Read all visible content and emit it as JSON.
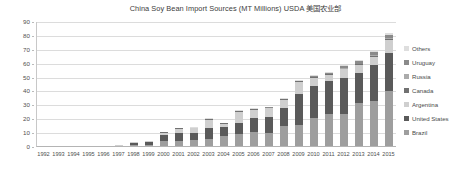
{
  "chart_data": {
    "type": "bar",
    "subtype": "stacked-column",
    "title": "China Soy Bean Import Sources (MT Millions) USDA  美国农业部",
    "xlabel": "",
    "ylabel": "",
    "ylim": [
      0,
      90
    ],
    "ytick_step": 10,
    "yticks": [
      0,
      10,
      20,
      30,
      40,
      50,
      60,
      70,
      80,
      90
    ],
    "grid": true,
    "legend_position": "right",
    "categories": [
      "1992",
      "1993",
      "1994",
      "1995",
      "1996",
      "1997",
      "1998",
      "1999",
      "2000",
      "2001",
      "2002",
      "2003",
      "2004",
      "2005",
      "2006",
      "2007",
      "2008",
      "2009",
      "2010",
      "2011",
      "2012",
      "2013",
      "2014",
      "2015"
    ],
    "series": [
      {
        "name": "Brazil",
        "color": "#9e9e9e",
        "values": [
          0,
          0,
          0,
          0,
          0.1,
          0.3,
          1.4,
          1.6,
          4.2,
          4.6,
          5.4,
          6.0,
          8.1,
          9.5,
          11.0,
          10.3,
          15.0,
          16.0,
          21.0,
          24.0,
          24.0,
          32.0,
          33.0,
          40.0
        ]
      },
      {
        "name": "United States",
        "color": "#5a5a5a",
        "values": [
          0,
          0,
          0,
          0,
          0.1,
          0.4,
          1.5,
          2.0,
          4.5,
          5.5,
          5.0,
          7.8,
          6.0,
          8.0,
          10.0,
          11.5,
          13.0,
          22.0,
          23.0,
          23.5,
          26.0,
          21.0,
          26.0,
          28.0
        ]
      },
      {
        "name": "Argentina",
        "color": "#cfcfcf",
        "values": [
          0,
          0,
          0,
          0,
          0,
          0.1,
          0.3,
          0.4,
          1.5,
          3.0,
          3.0,
          6.0,
          2.5,
          8.0,
          6.0,
          6.0,
          6.0,
          9.0,
          6.0,
          4.5,
          6.0,
          6.0,
          6.0,
          9.0
        ]
      },
      {
        "name": "Canada",
        "color": "#717171",
        "values": [
          0,
          0,
          0,
          0,
          0,
          0,
          0,
          0,
          0.1,
          0.1,
          0.1,
          0.1,
          0.2,
          0.2,
          0.2,
          0.3,
          0.3,
          0.4,
          0.4,
          0.5,
          0.5,
          0.6,
          0.7,
          0.8
        ]
      },
      {
        "name": "Russia",
        "color": "#ababab",
        "values": [
          0,
          0,
          0,
          0,
          0,
          0,
          0,
          0,
          0,
          0,
          0,
          0,
          0,
          0,
          0,
          0,
          0,
          0,
          0,
          0,
          0.1,
          0.2,
          0.3,
          0.4
        ]
      },
      {
        "name": "Uruguay",
        "color": "#8a8a8a",
        "values": [
          0,
          0,
          0,
          0,
          0,
          0,
          0,
          0,
          0,
          0,
          0,
          0,
          0,
          0,
          0,
          0.1,
          0.2,
          0.4,
          0.6,
          1.0,
          1.5,
          1.8,
          2.0,
          2.5
        ]
      },
      {
        "name": "Others",
        "color": "#dedede",
        "values": [
          0,
          0,
          0,
          0,
          0,
          0,
          0.1,
          0.1,
          0.2,
          0.2,
          0.2,
          0.3,
          0.3,
          0.4,
          0.4,
          0.5,
          0.5,
          0.6,
          0.7,
          0.8,
          0.9,
          1.0,
          1.2,
          1.5
        ]
      }
    ],
    "totals": [
      0,
      0,
      0,
      0,
      0.2,
      0.8,
      3.3,
      4.1,
      10.5,
      13.4,
      13.7,
      20.2,
      17.1,
      26.1,
      27.6,
      28.7,
      35.0,
      48.4,
      51.7,
      54.3,
      59.0,
      62.6,
      69.2,
      82.2
    ],
    "legend_order_top_to_bottom": [
      "Others",
      "Uruguay",
      "Russia",
      "Canada",
      "Argentina",
      "United States",
      "Brazil"
    ]
  }
}
